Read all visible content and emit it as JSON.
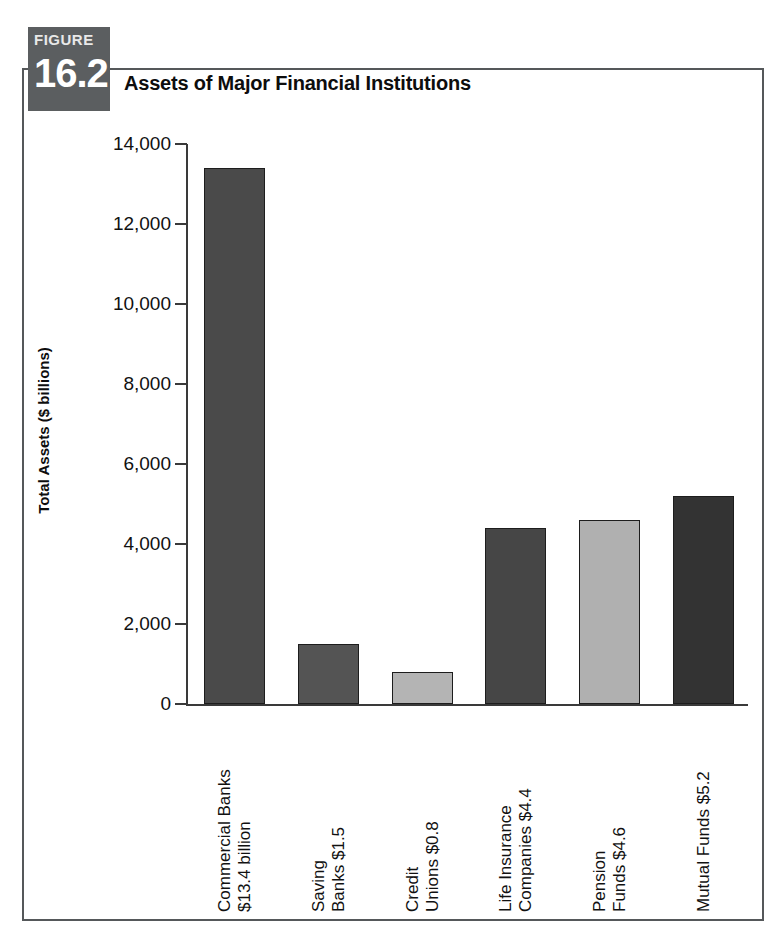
{
  "figure": {
    "label_word": "FIGURE",
    "number": "16.2",
    "title": "Assets of Major Financial Institutions",
    "badge_color": "#5b5e60",
    "frame_color": "#55585a"
  },
  "chart_data": {
    "type": "bar",
    "title": "Assets of Major Financial Institutions",
    "xlabel": "",
    "ylabel": "Total Assets ($ billions)",
    "ylim": [
      0,
      14000
    ],
    "yticks": [
      0,
      2000,
      4000,
      6000,
      8000,
      10000,
      12000,
      14000
    ],
    "ytick_labels": [
      "0",
      "2,000",
      "4,000",
      "6,000",
      "8,000",
      "10,000",
      "12,000",
      "14,000"
    ],
    "grid": false,
    "legend": "none",
    "categories": [
      "Commercial Banks $13.4 billion",
      "Saving Banks $1.5",
      "Credit Unions $0.8",
      "Life Insurance Companies $4.4",
      "Pension Funds $4.6",
      "Mutual Funds $5.2"
    ],
    "category_lines": [
      [
        "Commercial Banks",
        "$13.4 billion"
      ],
      [
        "Saving",
        "Banks $1.5"
      ],
      [
        "Credit",
        "Unions $0.8"
      ],
      [
        "Life Insurance",
        "Companies $4.4"
      ],
      [
        "Pension",
        "Funds $4.6"
      ],
      [
        "Mutual Funds $5.2",
        ""
      ]
    ],
    "values": [
      13400,
      1500,
      800,
      4400,
      4600,
      5200
    ],
    "bar_colors": [
      "#4a4a4a",
      "#545454",
      "#b4b4b4",
      "#464646",
      "#b0b0b0",
      "#333333"
    ]
  }
}
